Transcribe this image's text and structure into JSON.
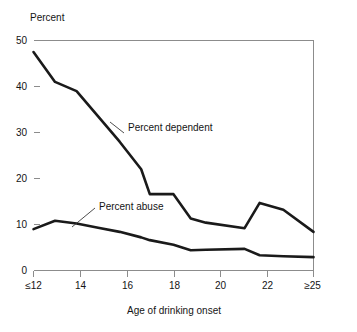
{
  "chart_data": {
    "type": "line",
    "title": "",
    "ylabel": "Percent",
    "xlabel": "Age of drinking onset",
    "ylim": [
      0,
      50
    ],
    "yticks": [
      0,
      10,
      20,
      30,
      40,
      50
    ],
    "ytick_labels": [
      "0",
      "10",
      "20",
      "30",
      "40",
      "50"
    ],
    "xlim": [
      12,
      25
    ],
    "xticks": [
      12,
      14,
      16,
      18,
      20,
      22,
      25
    ],
    "xtick_labels": [
      "≤12",
      "14",
      "16",
      "18",
      "20",
      "22",
      "≥25"
    ],
    "grid": false,
    "legend_position": "inline-annotation",
    "x": [
      12,
      13,
      14,
      15,
      16,
      17,
      17.4,
      18.5,
      19.3,
      20,
      21.8,
      22.5,
      23.6,
      25
    ],
    "series": [
      {
        "name": "Percent dependent",
        "values": [
          47.5,
          41.0,
          39.0,
          33.5,
          28.0,
          22.0,
          16.6,
          16.6,
          11.3,
          10.4,
          9.2,
          14.7,
          13.2,
          8.4
        ]
      },
      {
        "name": "Percent abuse",
        "values": [
          9.0,
          10.8,
          10.2,
          9.3,
          8.4,
          7.2,
          6.6,
          5.6,
          4.4,
          4.5,
          4.7,
          3.3,
          3.1,
          2.9
        ]
      }
    ],
    "annotations": [
      {
        "text": "Percent dependent",
        "id": "percent-dependent-label"
      },
      {
        "text": "Percent abuse",
        "id": "percent-abuse-label"
      }
    ],
    "colors": {
      "line": "#1a1a1a",
      "frame": "#8c8c8c",
      "background": "#ffffff",
      "text": "#141414"
    }
  }
}
